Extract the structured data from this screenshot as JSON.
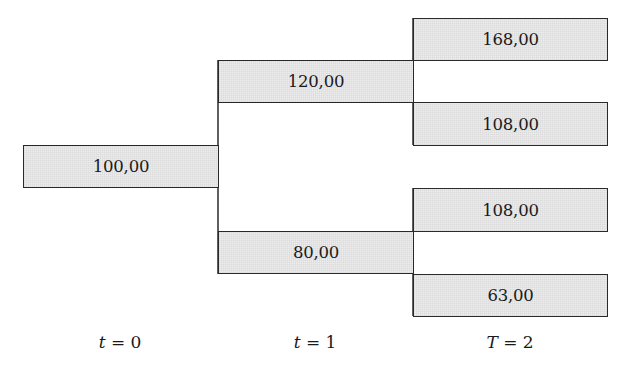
{
  "diagram": {
    "type": "binomial-tree",
    "nodes": [
      {
        "id": "n0",
        "time": 0,
        "value": "100,00"
      },
      {
        "id": "n1u",
        "time": 1,
        "value": "120,00"
      },
      {
        "id": "n1d",
        "time": 1,
        "value": "80,00"
      },
      {
        "id": "n2uu",
        "time": 2,
        "value": "168,00"
      },
      {
        "id": "n2ud",
        "time": 2,
        "value": "108,00"
      },
      {
        "id": "n2du",
        "time": 2,
        "value": "108,00"
      },
      {
        "id": "n2dd",
        "time": 2,
        "value": "63,00"
      }
    ],
    "edges": [
      [
        "n0",
        "n1u"
      ],
      [
        "n0",
        "n1d"
      ],
      [
        "n1u",
        "n2uu"
      ],
      [
        "n1u",
        "n2ud"
      ],
      [
        "n1d",
        "n2du"
      ],
      [
        "n1d",
        "n2dd"
      ]
    ],
    "time_labels": [
      {
        "var": "t",
        "eq": " = 0"
      },
      {
        "var": "t",
        "eq": " = 1"
      },
      {
        "var": "T",
        "eq": " = 2"
      }
    ]
  },
  "colors": {
    "node_fill": "#ececec",
    "node_border": "#2a2a2a",
    "text": "#1a1a1a"
  }
}
